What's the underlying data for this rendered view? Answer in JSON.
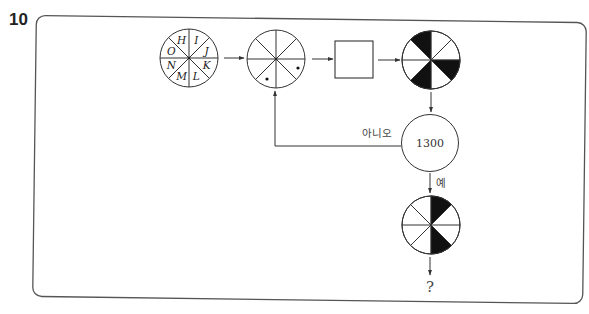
{
  "question": {
    "number": "10"
  },
  "diagram": {
    "type": "flowchart",
    "start_circle": {
      "letters": {
        "top_left": "H",
        "top_right": "I",
        "right_upper": "J",
        "right_lower": "K",
        "bottom_right": "L",
        "bottom_left": "M",
        "left_lower": "N",
        "left_upper": "O"
      },
      "sector_order_clockwise_from_top": [
        "I",
        "J",
        "K",
        "L",
        "M",
        "N",
        "O",
        "H"
      ]
    },
    "dot_circle": {
      "dots": [
        "right-lower sector",
        "bottom-left sector"
      ]
    },
    "process_box": {
      "label": ""
    },
    "target_circle": {
      "black_sectors": [
        "right-lower",
        "bottom-left",
        "top-left"
      ]
    },
    "decision": {
      "value": "1300",
      "no_label": "아니오",
      "yes_label": "예"
    },
    "result_circle": {
      "black_sectors": [
        "top-right",
        "bottom-right"
      ]
    },
    "output": {
      "label": "?"
    }
  }
}
